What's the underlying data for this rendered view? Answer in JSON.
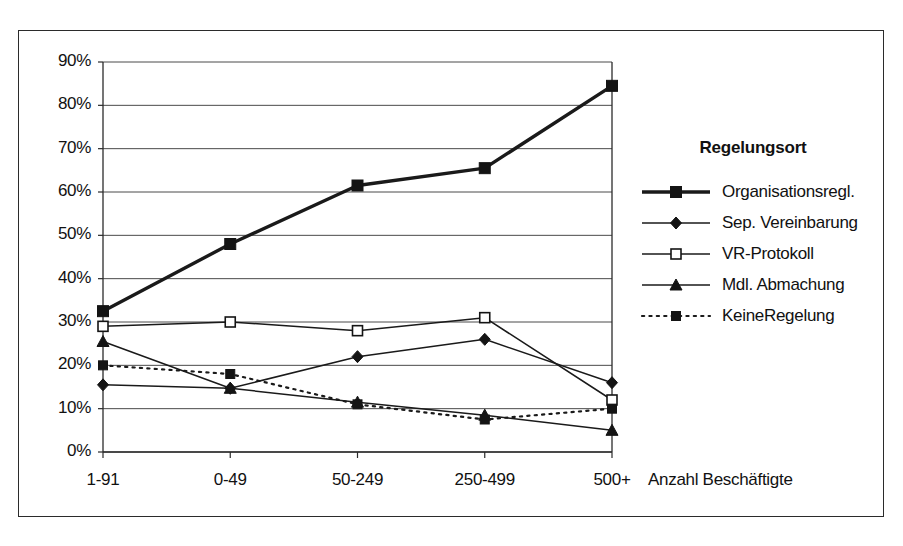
{
  "chart_data": {
    "type": "line",
    "title": "",
    "xlabel": "Anzahl Beschäftigte",
    "ylabel": "",
    "categories": [
      "1-91",
      "0-49",
      "50-249",
      "250-499",
      "500+"
    ],
    "ylim": [
      0,
      90
    ],
    "ytick_labels": [
      "0%",
      "10%",
      "20%",
      "30%",
      "40%",
      "50%",
      "60%",
      "70%",
      "80%",
      "90%"
    ],
    "ytick_values": [
      0,
      10,
      20,
      30,
      40,
      50,
      60,
      70,
      80,
      90
    ],
    "grid": true,
    "legend_position": "right",
    "legend_title": "Regelungsort",
    "series": [
      {
        "name": "Organisationsregl.",
        "values": [
          32.5,
          48.0,
          61.5,
          65.5,
          84.5
        ],
        "marker": "filled-square",
        "line": "solid-thick",
        "color": "#1a1a1a"
      },
      {
        "name": "Sep. Vereinbarung",
        "values": [
          15.5,
          14.7,
          22.0,
          26.0,
          16.0
        ],
        "marker": "filled-diamond",
        "line": "solid",
        "color": "#1a1a1a"
      },
      {
        "name": "VR-Protokoll",
        "values": [
          29.0,
          30.0,
          28.0,
          31.0,
          12.0
        ],
        "marker": "open-square",
        "line": "solid",
        "color": "#1a1a1a"
      },
      {
        "name": "Mdl. Abmachung",
        "values": [
          25.5,
          14.7,
          11.5,
          8.5,
          5.0
        ],
        "marker": "filled-triangle",
        "line": "solid",
        "color": "#1a1a1a"
      },
      {
        "name": "KeineRegelung",
        "values": [
          20.0,
          18.0,
          11.0,
          7.5,
          10.0
        ],
        "marker": "filled-square-small",
        "line": "dotted",
        "color": "#1a1a1a"
      }
    ]
  }
}
